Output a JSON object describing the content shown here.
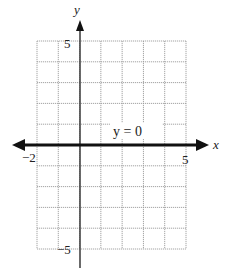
{
  "chart_data": {
    "type": "line",
    "title": "",
    "xlabel": "x",
    "ylabel": "y",
    "xlim": [
      -2,
      5
    ],
    "ylim": [
      -5,
      5
    ],
    "grid": true,
    "x_tick_labels": [
      "-2",
      "5"
    ],
    "y_tick_labels": [
      "5",
      "-5"
    ],
    "series": [
      {
        "name": "y = 0",
        "x": [
          -2,
          5
        ],
        "y": [
          0,
          0
        ],
        "style": "bold line with arrows on both ends"
      }
    ],
    "annotations": [
      {
        "text": "y = 0",
        "x": 2.5,
        "y": 0.6
      }
    ]
  },
  "labels": {
    "x_axis": "x",
    "y_axis": "y",
    "x_min": "−2",
    "x_max": "5",
    "y_max": "5",
    "y_min": "−5",
    "equation": "y = 0"
  },
  "colors": {
    "grid": "#9a9a9a",
    "axis": "#333333",
    "line": "#111111"
  }
}
